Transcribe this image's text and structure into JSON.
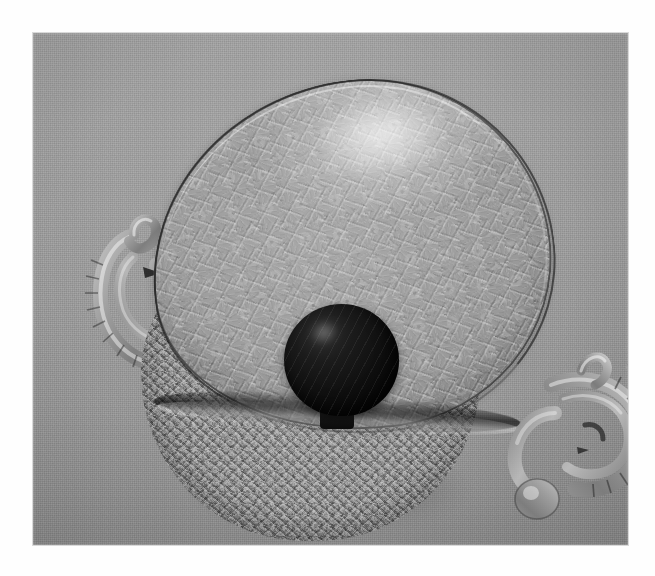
{
  "media": {
    "kind": "photograph",
    "color_mode": "black-and-white",
    "orientation": "landscape",
    "border_color": "#ffffff",
    "alt": "Black and white photograph of an ornate pressed glass covered bowl with a dark round knob finial and two elaborate curled glass handles, shown against a plain grey fabric backdrop."
  },
  "frame": {
    "canvas_width": 655,
    "canvas_height": 576,
    "photo_left": 33,
    "photo_top": 33,
    "photo_width": 595,
    "photo_height": 512
  },
  "background": {
    "label": "grey fabric backdrop",
    "base_color": "#9b9b9b",
    "highlight_color": "#a6a6a6",
    "shadow_color": "#8b8b8b",
    "texture": "fine woven canvas weave"
  },
  "subject": {
    "name": "covered glass bowl",
    "material": "pressed / cut clear glass",
    "parts": [
      {
        "id": "lid",
        "label": "domed teardrop lid",
        "surface": "all-over etched floral and geometric pressed pattern",
        "rim": "thin dark outlined rim with bright glass highlight",
        "tone_light": "#b0b0b0",
        "tone_mid": "#9c9c9c",
        "tone_dark": "#8a8a8a"
      },
      {
        "id": "knob",
        "label": "round knob finial",
        "surface": "opaque dark sphere on a short stem",
        "tone_light": "#2e2e2e",
        "tone_dark": "#060606"
      },
      {
        "id": "bowl",
        "label": "lower bowl body",
        "surface": "densely textured pressed glass, sparkling facets",
        "tone_light": "#8e8e8e",
        "tone_dark": "#6c6c6c"
      },
      {
        "id": "handle-left",
        "label": "left curled applied glass handle",
        "surface": "ribbed scrolled loop with crimped edge"
      },
      {
        "id": "handle-right",
        "label": "right curled applied glass handle",
        "surface": "ribbed scrolled loop with crimped edge and pendant drop"
      }
    ],
    "shadow": {
      "label": "soft contact shadow",
      "color": "rgba(0,0,0,0.22)"
    }
  }
}
